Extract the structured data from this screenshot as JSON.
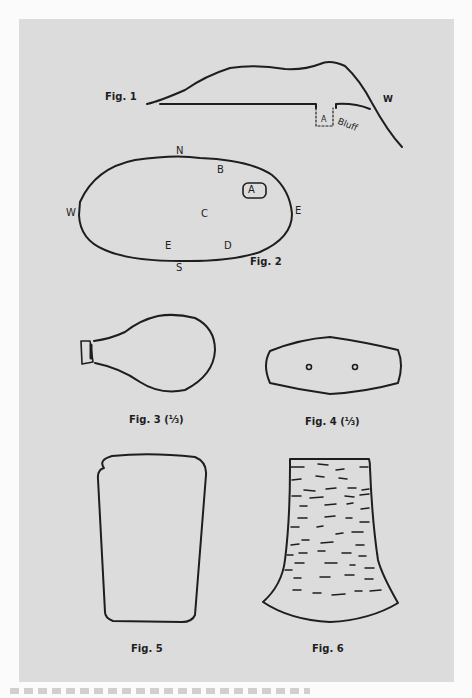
{
  "plate": {
    "background": "#dcdcdc",
    "stroke": "#1e1e1e"
  },
  "fig1": {
    "label": "Fig. 1",
    "marker_a": "A",
    "marker_w": "W",
    "bluff_label": "Bluff"
  },
  "fig2": {
    "label": "Fig. 2",
    "compass": {
      "north": "N",
      "south": "S",
      "east": "E",
      "west": "W"
    },
    "points": {
      "a": "A",
      "b": "B",
      "c": "C",
      "d": "D",
      "e": "E"
    }
  },
  "fig3": {
    "label": "Fig. 3 (⅓)"
  },
  "fig4": {
    "label": "Fig. 4 (⅓)"
  },
  "fig5": {
    "label": "Fig. 5"
  },
  "fig6": {
    "label": "Fig. 6"
  }
}
